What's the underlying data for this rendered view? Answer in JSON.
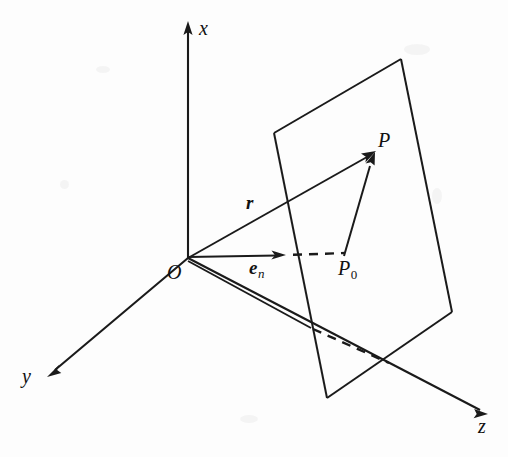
{
  "figure": {
    "background_color": "#fdfdfd",
    "ink_color": "#1a1a1a",
    "axes": [
      {
        "name": "x-axis",
        "label": "x",
        "label_x": 199,
        "label_y": 18,
        "direction": "up"
      },
      {
        "name": "y-axis",
        "label": "y",
        "label_x": 22,
        "label_y": 366,
        "direction": "down-left"
      },
      {
        "name": "z-axis",
        "label": "z",
        "label_x": 478,
        "label_y": 416,
        "direction": "down-right"
      }
    ],
    "points": [
      {
        "name": "origin",
        "label": "O",
        "label_x": 167,
        "label_y": 262
      },
      {
        "name": "point-p",
        "label": "P",
        "label_x": 378,
        "label_y": 130
      },
      {
        "name": "point-p0",
        "label": "P",
        "subscript": "0",
        "label_x": 338,
        "label_y": 258
      }
    ],
    "vectors": [
      {
        "name": "position-vector",
        "label": "r",
        "label_x": 246,
        "label_y": 193,
        "style": "bold-italic"
      },
      {
        "name": "unit-normal-vector",
        "label": "e",
        "subscript": "n",
        "label_x": 249,
        "label_y": 258,
        "style": "bold-italic"
      }
    ]
  },
  "geometry": {
    "origin": [
      188,
      258
    ],
    "x_axis": {
      "from": [
        188,
        258
      ],
      "to": [
        188,
        26
      ]
    },
    "y_axis": {
      "from": [
        188,
        258
      ],
      "to": [
        52,
        372
      ]
    },
    "z_axis": {
      "from": [
        188,
        258
      ],
      "to": [
        484,
        412
      ]
    },
    "plane_corners": [
      [
        274,
        133
      ],
      [
        401,
        59
      ],
      [
        452,
        312
      ],
      [
        327,
        398
      ]
    ],
    "r_vector": {
      "from": [
        188,
        258
      ],
      "to": [
        374,
        153
      ]
    },
    "en_vector": {
      "from": [
        188,
        257
      ],
      "to": [
        284,
        255
      ]
    },
    "en_dashed": {
      "from": [
        292,
        255
      ],
      "to": [
        345,
        253
      ]
    },
    "p0_to_p": {
      "from": [
        344,
        256
      ],
      "to": [
        374,
        154
      ]
    },
    "origin_to_plane_edge": {
      "from": [
        188,
        261
      ],
      "to": [
        311,
        328
      ]
    },
    "lower_dashed": {
      "from": [
        313,
        329
      ],
      "to": [
        389,
        363
      ]
    }
  }
}
